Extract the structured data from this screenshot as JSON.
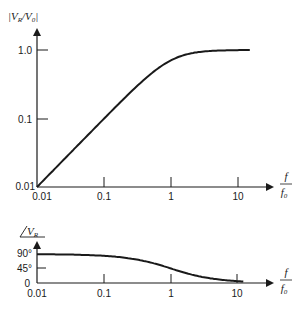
{
  "chart_data": [
    {
      "type": "line",
      "title": "",
      "ylabel": "|V_R/V_0|",
      "xlabel": "f/f_0",
      "xscale": "log",
      "yscale": "log",
      "xlim": [
        0.01,
        20
      ],
      "ylim": [
        0.01,
        1.5
      ],
      "x_ticks": [
        "0.01",
        "0.1",
        "1",
        "10"
      ],
      "y_ticks": [
        "0.01",
        "0.1",
        "1.0"
      ],
      "grid": false,
      "series": [
        {
          "name": "|V_R/V_0|",
          "x": [
            0.01,
            0.03,
            0.1,
            0.3,
            0.5,
            0.7,
            1,
            1.5,
            2,
            3,
            5,
            10,
            15
          ],
          "y": [
            0.01,
            0.03,
            0.0995,
            0.287,
            0.447,
            0.573,
            0.707,
            0.832,
            0.894,
            0.949,
            0.981,
            0.995,
            0.998
          ]
        }
      ]
    },
    {
      "type": "line",
      "title": "",
      "ylabel": "∠V_R",
      "xlabel": "f/f_0",
      "xscale": "log",
      "yscale": "linear",
      "xlim": [
        0.01,
        20
      ],
      "ylim": [
        0,
        100
      ],
      "x_ticks": [
        "0.01",
        "0.1",
        "1",
        "10"
      ],
      "y_ticks": [
        "0",
        "45°",
        "90°"
      ],
      "grid": false,
      "series": [
        {
          "name": "phase (degrees)",
          "x": [
            0.01,
            0.03,
            0.1,
            0.3,
            0.5,
            0.7,
            1,
            1.5,
            2,
            3,
            5,
            10,
            15
          ],
          "y": [
            89.4,
            88.3,
            84.3,
            73.3,
            63.4,
            55.0,
            45.0,
            33.7,
            26.6,
            18.4,
            11.3,
            5.7,
            3.8
          ]
        }
      ]
    }
  ],
  "top": {
    "ylabel": "|V",
    "ylabel_sub1": "R",
    "ylabel_mid": "/V",
    "ylabel_sub2": "0",
    "ylabel_end": "|",
    "y_ticks": [
      "1.0",
      "0.1",
      "0.01"
    ],
    "x_ticks": [
      "0.01",
      "0.1",
      "1",
      "10"
    ],
    "x_label_num": "f",
    "x_label_den": "f",
    "x_label_den_sub": "0"
  },
  "bottom": {
    "ylabel_angle": "∠",
    "ylabel": "V",
    "ylabel_sub": "R",
    "y_ticks": [
      "90°",
      "45°",
      "0"
    ],
    "x_ticks": [
      "0.01",
      "0.1",
      "1",
      "10"
    ],
    "x_label_num": "f",
    "x_label_den": "f",
    "x_label_den_sub": "0"
  }
}
